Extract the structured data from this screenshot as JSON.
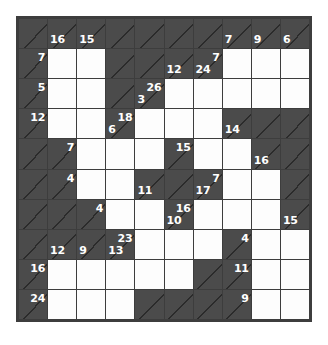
{
  "puzzle": {
    "type": "kakuro",
    "rows": 10,
    "cols": 10,
    "colors": {
      "block": "#4b4b4b",
      "white": "#fdfdfd",
      "border": "#3d3d3d",
      "clue_text": "#ffffff",
      "diagonal": "#2b2b2b",
      "page_background": "#ffffff"
    },
    "legend": {
      "across_position": "top-right",
      "down_position": "bottom-left"
    },
    "cells": [
      [
        {
          "t": "block"
        },
        {
          "t": "block",
          "down": 16
        },
        {
          "t": "block",
          "down": 15
        },
        {
          "t": "block"
        },
        {
          "t": "block"
        },
        {
          "t": "block"
        },
        {
          "t": "block"
        },
        {
          "t": "block",
          "down": 7
        },
        {
          "t": "block",
          "down": 9
        },
        {
          "t": "block",
          "down": 6
        }
      ],
      [
        {
          "t": "block",
          "across": 7
        },
        {
          "t": "white"
        },
        {
          "t": "white"
        },
        {
          "t": "block"
        },
        {
          "t": "block"
        },
        {
          "t": "block",
          "down": 12
        },
        {
          "t": "block",
          "across": 7,
          "down": 24
        },
        {
          "t": "white"
        },
        {
          "t": "white"
        },
        {
          "t": "white"
        }
      ],
      [
        {
          "t": "block",
          "across": 5
        },
        {
          "t": "white"
        },
        {
          "t": "white"
        },
        {
          "t": "block"
        },
        {
          "t": "block",
          "across": 26,
          "down": 3
        },
        {
          "t": "white"
        },
        {
          "t": "white"
        },
        {
          "t": "white"
        },
        {
          "t": "white"
        },
        {
          "t": "white"
        }
      ],
      [
        {
          "t": "block",
          "across": 12
        },
        {
          "t": "white"
        },
        {
          "t": "white"
        },
        {
          "t": "block",
          "across": 18,
          "down": 6
        },
        {
          "t": "white"
        },
        {
          "t": "white"
        },
        {
          "t": "white"
        },
        {
          "t": "block",
          "down": 14
        },
        {
          "t": "block"
        },
        {
          "t": "block"
        }
      ],
      [
        {
          "t": "block"
        },
        {
          "t": "block",
          "across": 7
        },
        {
          "t": "white"
        },
        {
          "t": "white"
        },
        {
          "t": "white"
        },
        {
          "t": "block",
          "across": 15
        },
        {
          "t": "white"
        },
        {
          "t": "white"
        },
        {
          "t": "block",
          "down": 16
        },
        {
          "t": "block"
        }
      ],
      [
        {
          "t": "block"
        },
        {
          "t": "block",
          "across": 4
        },
        {
          "t": "white"
        },
        {
          "t": "white"
        },
        {
          "t": "block",
          "down": 11
        },
        {
          "t": "block"
        },
        {
          "t": "block",
          "across": 7,
          "down": 17
        },
        {
          "t": "white"
        },
        {
          "t": "white"
        },
        {
          "t": "block"
        }
      ],
      [
        {
          "t": "block"
        },
        {
          "t": "block"
        },
        {
          "t": "block",
          "across": 4
        },
        {
          "t": "white"
        },
        {
          "t": "white"
        },
        {
          "t": "block",
          "across": 16,
          "down": 10
        },
        {
          "t": "white"
        },
        {
          "t": "white"
        },
        {
          "t": "white"
        },
        {
          "t": "block",
          "down": 15
        }
      ],
      [
        {
          "t": "block"
        },
        {
          "t": "block",
          "down": 12
        },
        {
          "t": "block",
          "down": 9
        },
        {
          "t": "block",
          "across": 23,
          "down": 13
        },
        {
          "t": "white"
        },
        {
          "t": "white"
        },
        {
          "t": "white"
        },
        {
          "t": "block",
          "across": 4
        },
        {
          "t": "white"
        },
        {
          "t": "white"
        }
      ],
      [
        {
          "t": "block",
          "across": 16
        },
        {
          "t": "white"
        },
        {
          "t": "white"
        },
        {
          "t": "white"
        },
        {
          "t": "white"
        },
        {
          "t": "white"
        },
        {
          "t": "block"
        },
        {
          "t": "block",
          "across": 11
        },
        {
          "t": "white"
        },
        {
          "t": "white"
        }
      ],
      [
        {
          "t": "block",
          "across": 24
        },
        {
          "t": "white"
        },
        {
          "t": "white"
        },
        {
          "t": "white"
        },
        {
          "t": "block"
        },
        {
          "t": "block"
        },
        {
          "t": "block"
        },
        {
          "t": "block",
          "across": 9
        },
        {
          "t": "white"
        },
        {
          "t": "white"
        }
      ]
    ]
  }
}
